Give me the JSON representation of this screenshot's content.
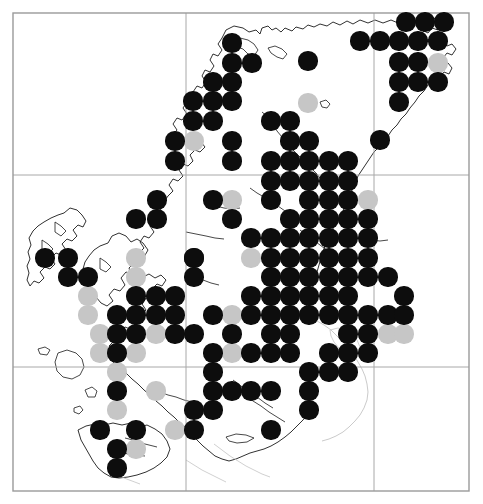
{
  "map": {
    "title": "Species distribution map",
    "region_label": "Northern Scotland and Hebrides",
    "background_color": "#ffffff",
    "frame": {
      "color": "#9a9a9a",
      "line_width": 1.4,
      "left": 13,
      "top": 13,
      "right": 469,
      "bottom": 491
    },
    "grid": {
      "color": "#a8a8a8",
      "line_width": 1.0,
      "vertical_lines": [
        186,
        374
      ],
      "horizontal_lines": [
        175,
        367
      ]
    },
    "coastline": {
      "color": "#1a1a1a",
      "line_width": 0.9,
      "secondary_color": "#c4c4c4"
    },
    "symbol_legend": [
      {
        "key": "present_recent",
        "color": "#0d0d0d",
        "label": "Recent record"
      },
      {
        "key": "present_old",
        "color": "#c6c6c6",
        "label": "Older record"
      }
    ],
    "dot_radius": 9.6,
    "grid_spacing_x": 19.4,
    "grid_spacing_y": 19.4
  },
  "chart_data": {
    "type": "scatter",
    "xlabel": "",
    "ylabel": "",
    "xlim": [
      13,
      469
    ],
    "ylim": [
      13,
      491
    ],
    "grid": true,
    "legend": [
      "Recent record",
      "Older record"
    ],
    "legend_position": "none",
    "series": [
      {
        "name": "Recent record",
        "color": "#0d0d0d",
        "points": [
          [
            406,
            22
          ],
          [
            425,
            22
          ],
          [
            444,
            22
          ],
          [
            360,
            41
          ],
          [
            380,
            41
          ],
          [
            399,
            41
          ],
          [
            418,
            41
          ],
          [
            438,
            41
          ],
          [
            232,
            43
          ],
          [
            232,
            63
          ],
          [
            252,
            63
          ],
          [
            308,
            61
          ],
          [
            399,
            62
          ],
          [
            418,
            62
          ],
          [
            213,
            82
          ],
          [
            232,
            82
          ],
          [
            399,
            82
          ],
          [
            418,
            82
          ],
          [
            438,
            82
          ],
          [
            193,
            101
          ],
          [
            213,
            101
          ],
          [
            232,
            101
          ],
          [
            399,
            102
          ],
          [
            193,
            121
          ],
          [
            213,
            121
          ],
          [
            271,
            121
          ],
          [
            290,
            121
          ],
          [
            175,
            141
          ],
          [
            232,
            141
          ],
          [
            290,
            141
          ],
          [
            309,
            141
          ],
          [
            380,
            140
          ],
          [
            175,
            161
          ],
          [
            232,
            161
          ],
          [
            271,
            161
          ],
          [
            290,
            161
          ],
          [
            309,
            161
          ],
          [
            329,
            161
          ],
          [
            348,
            161
          ],
          [
            271,
            181
          ],
          [
            290,
            181
          ],
          [
            309,
            181
          ],
          [
            329,
            181
          ],
          [
            348,
            181
          ],
          [
            157,
            200
          ],
          [
            213,
            200
          ],
          [
            271,
            200
          ],
          [
            309,
            200
          ],
          [
            329,
            200
          ],
          [
            348,
            200
          ],
          [
            136,
            219
          ],
          [
            157,
            219
          ],
          [
            232,
            219
          ],
          [
            290,
            219
          ],
          [
            309,
            219
          ],
          [
            329,
            219
          ],
          [
            348,
            219
          ],
          [
            368,
            219
          ],
          [
            251,
            238
          ],
          [
            271,
            238
          ],
          [
            290,
            238
          ],
          [
            309,
            238
          ],
          [
            329,
            238
          ],
          [
            348,
            238
          ],
          [
            368,
            238
          ],
          [
            194,
            258
          ],
          [
            45,
            258
          ],
          [
            68,
            258
          ],
          [
            194,
            258
          ],
          [
            271,
            258
          ],
          [
            290,
            258
          ],
          [
            309,
            258
          ],
          [
            329,
            258
          ],
          [
            348,
            258
          ],
          [
            368,
            258
          ],
          [
            68,
            277
          ],
          [
            88,
            277
          ],
          [
            194,
            277
          ],
          [
            271,
            277
          ],
          [
            290,
            277
          ],
          [
            309,
            277
          ],
          [
            329,
            277
          ],
          [
            348,
            277
          ],
          [
            368,
            277
          ],
          [
            388,
            277
          ],
          [
            136,
            296
          ],
          [
            156,
            296
          ],
          [
            175,
            296
          ],
          [
            251,
            296
          ],
          [
            271,
            296
          ],
          [
            290,
            296
          ],
          [
            309,
            296
          ],
          [
            329,
            296
          ],
          [
            348,
            296
          ],
          [
            404,
            296
          ],
          [
            117,
            315
          ],
          [
            136,
            315
          ],
          [
            156,
            315
          ],
          [
            175,
            315
          ],
          [
            213,
            315
          ],
          [
            251,
            315
          ],
          [
            271,
            315
          ],
          [
            290,
            315
          ],
          [
            309,
            315
          ],
          [
            329,
            315
          ],
          [
            348,
            315
          ],
          [
            368,
            315
          ],
          [
            388,
            315
          ],
          [
            404,
            315
          ],
          [
            117,
            334
          ],
          [
            136,
            334
          ],
          [
            175,
            334
          ],
          [
            194,
            334
          ],
          [
            232,
            334
          ],
          [
            271,
            334
          ],
          [
            290,
            334
          ],
          [
            348,
            334
          ],
          [
            368,
            334
          ],
          [
            117,
            353
          ],
          [
            213,
            353
          ],
          [
            251,
            353
          ],
          [
            271,
            353
          ],
          [
            290,
            353
          ],
          [
            329,
            353
          ],
          [
            348,
            353
          ],
          [
            368,
            353
          ],
          [
            213,
            372
          ],
          [
            309,
            372
          ],
          [
            329,
            372
          ],
          [
            348,
            372
          ],
          [
            117,
            391
          ],
          [
            213,
            391
          ],
          [
            232,
            391
          ],
          [
            251,
            391
          ],
          [
            271,
            391
          ],
          [
            309,
            391
          ],
          [
            194,
            410
          ],
          [
            213,
            410
          ],
          [
            309,
            410
          ],
          [
            100,
            430
          ],
          [
            136,
            430
          ],
          [
            194,
            430
          ],
          [
            271,
            430
          ],
          [
            117,
            449
          ],
          [
            117,
            468
          ]
        ]
      },
      {
        "name": "Older record",
        "color": "#c6c6c6",
        "points": [
          [
            438,
            63
          ],
          [
            308,
            103
          ],
          [
            194,
            141
          ],
          [
            232,
            161
          ],
          [
            232,
            200
          ],
          [
            271,
            200
          ],
          [
            368,
            200
          ],
          [
            136,
            258
          ],
          [
            136,
            277
          ],
          [
            251,
            258
          ],
          [
            175,
            296
          ],
          [
            88,
            296
          ],
          [
            88,
            315
          ],
          [
            232,
            315
          ],
          [
            100,
            334
          ],
          [
            156,
            334
          ],
          [
            100,
            353
          ],
          [
            136,
            353
          ],
          [
            232,
            353
          ],
          [
            388,
            334
          ],
          [
            404,
            334
          ],
          [
            117,
            372
          ],
          [
            156,
            391
          ],
          [
            175,
            430
          ],
          [
            117,
            410
          ],
          [
            136,
            449
          ]
        ]
      }
    ]
  }
}
